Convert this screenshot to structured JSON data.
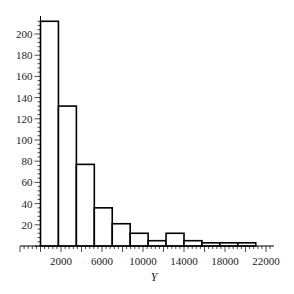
{
  "chart_data": {
    "type": "bar",
    "subtype": "histogram",
    "title": "",
    "xlabel": "Y",
    "ylabel": "",
    "bin_width": 1750,
    "bins": [
      {
        "start": 0,
        "end": 1750,
        "count": 212
      },
      {
        "start": 1750,
        "end": 3500,
        "count": 132
      },
      {
        "start": 3500,
        "end": 5250,
        "count": 77
      },
      {
        "start": 5250,
        "end": 7000,
        "count": 36
      },
      {
        "start": 7000,
        "end": 8750,
        "count": 21
      },
      {
        "start": 8750,
        "end": 10500,
        "count": 12
      },
      {
        "start": 10500,
        "end": 12250,
        "count": 5
      },
      {
        "start": 12250,
        "end": 14000,
        "count": 12
      },
      {
        "start": 14000,
        "end": 15750,
        "count": 5
      },
      {
        "start": 15750,
        "end": 17500,
        "count": 3
      },
      {
        "start": 17500,
        "end": 19250,
        "count": 3
      },
      {
        "start": 19250,
        "end": 21000,
        "count": 3
      }
    ],
    "categories": [
      "0-1750",
      "1750-3500",
      "3500-5250",
      "5250-7000",
      "7000-8750",
      "8750-10500",
      "10500-12250",
      "12250-14000",
      "14000-15750",
      "15750-17500",
      "17500-19250",
      "19250-21000"
    ],
    "values": [
      212,
      132,
      77,
      36,
      21,
      12,
      5,
      12,
      5,
      3,
      3,
      3
    ],
    "xlim": [
      -2000,
      23000
    ],
    "ylim": [
      0,
      215
    ],
    "x_ticks": [
      2000,
      6000,
      10000,
      14000,
      18000,
      22000
    ],
    "x_tick_labels": [
      "2000",
      "6000",
      "10000",
      "14000",
      "18000",
      "22000"
    ],
    "y_ticks": [
      20,
      40,
      60,
      80,
      100,
      120,
      140,
      160,
      180,
      200
    ],
    "y_tick_labels": [
      "20",
      "40",
      "60",
      "80",
      "100",
      "120",
      "140",
      "160",
      "180",
      "200"
    ],
    "grid": false,
    "legend": null,
    "colors": {
      "bar_fill": "#ffffff",
      "bar_edge": "#000000",
      "axis": "#000000"
    }
  }
}
